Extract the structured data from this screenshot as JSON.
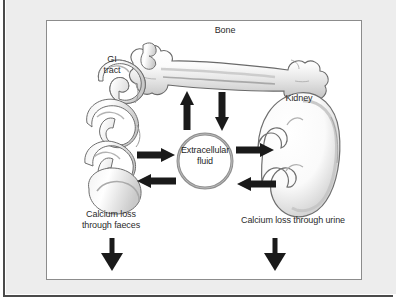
{
  "figure": {
    "type": "biological-diagram",
    "labels": {
      "bone": "Bone",
      "gi_tract": "GI\ntract",
      "kidney": "Kidney",
      "extracellular_fluid": "Extracellular\nfluid",
      "calcium_loss_faeces": "Calcium loss\nthrough faeces",
      "calcium_loss_urine": "Calcium loss through urine"
    },
    "illustrations": [
      {
        "name": "bone-illustration",
        "description": "long bone (femur) drawn horizontally at top"
      },
      {
        "name": "gi-tract-illustration",
        "description": "coiled intestine on the left"
      },
      {
        "name": "kidney-illustration",
        "description": "bean-shaped kidney on the right"
      },
      {
        "name": "extracellular-fluid-circle",
        "description": "grey ring circle at centre"
      }
    ],
    "arrows": [
      {
        "name": "arrow-ecf-to-bone",
        "direction": "up",
        "from": "Extracellular fluid",
        "to": "Bone"
      },
      {
        "name": "arrow-bone-to-ecf",
        "direction": "down",
        "from": "Bone",
        "to": "Extracellular fluid"
      },
      {
        "name": "arrow-gi-to-ecf",
        "direction": "right",
        "from": "GI tract",
        "to": "Extracellular fluid"
      },
      {
        "name": "arrow-ecf-to-gi",
        "direction": "left",
        "from": "Extracellular fluid",
        "to": "GI tract"
      },
      {
        "name": "arrow-ecf-to-kidney",
        "direction": "right",
        "from": "Extracellular fluid",
        "to": "Kidney"
      },
      {
        "name": "arrow-kidney-to-ecf",
        "direction": "left",
        "from": "Kidney",
        "to": "Extracellular fluid"
      },
      {
        "name": "arrow-faeces-loss",
        "direction": "down",
        "from": "GI tract",
        "to": "Calcium loss through faeces"
      },
      {
        "name": "arrow-urine-loss",
        "direction": "down",
        "from": "Kidney",
        "to": "Calcium loss through urine"
      }
    ],
    "colors": {
      "page_background": "#ffffff",
      "mat_background": "#ededed",
      "frame_border": "#8c8c8c",
      "edge_rule": "#4a4a4a",
      "arrow_fill": "#1a1a1a",
      "text": "#2b2b2b",
      "circle_ring": "#8f8f8f",
      "illustration_outline": "#6e6e6e"
    }
  }
}
